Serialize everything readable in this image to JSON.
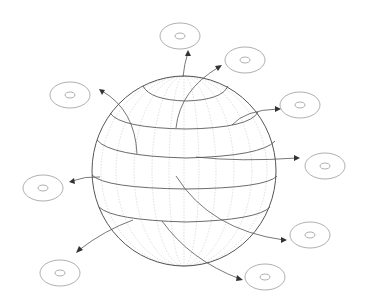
{
  "diagram": {
    "title": "",
    "colors": {
      "background": "#ffffff",
      "sphere_outline": "#555555",
      "latitude_lines": "#5a5a5a",
      "meridian_lines": "#c8c8c8",
      "arrows": "#555555",
      "viewer_icons": "#9a9a9a"
    },
    "sphere": {
      "cx": 184,
      "cy": 171,
      "rx": 92,
      "ry": 95
    },
    "viewer_icons": [
      {
        "id": "top",
        "cx": 180,
        "cy": 36
      },
      {
        "id": "upper-right",
        "cx": 245,
        "cy": 60
      },
      {
        "id": "right-top",
        "cx": 300,
        "cy": 105
      },
      {
        "id": "right-middle",
        "cx": 325,
        "cy": 166
      },
      {
        "id": "right-lower",
        "cx": 310,
        "cy": 235
      },
      {
        "id": "bottom-right",
        "cx": 265,
        "cy": 277
      },
      {
        "id": "bottom-left",
        "cx": 60,
        "cy": 273
      },
      {
        "id": "left-middle",
        "cx": 43,
        "cy": 188
      },
      {
        "id": "upper-left",
        "cx": 70,
        "cy": 95
      }
    ],
    "arrow_count": 9,
    "latitude_band_count": 5
  }
}
